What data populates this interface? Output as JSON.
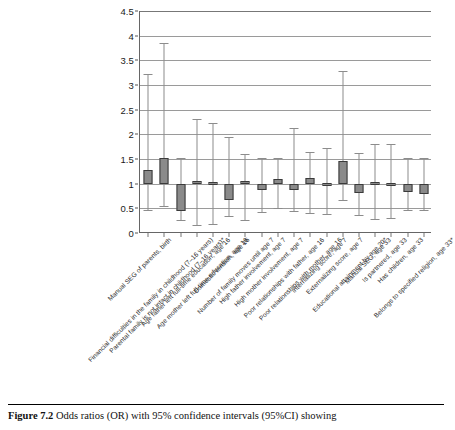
{
  "figure": {
    "caption_label": "Figure 7.2",
    "caption_text": "Odds ratios (OR) with 95% confidence intervals (95%CI) showing"
  },
  "chart_data": {
    "type": "bar",
    "title": "",
    "xlabel": "",
    "ylabel": "",
    "ylim": [
      0,
      4.5
    ],
    "grid": true,
    "legend": "none",
    "reference_line": 1,
    "ytick_labels": [
      "0",
      "0.5",
      "1",
      "1.5",
      "2",
      "2.5",
      "3",
      "3.5",
      "4",
      "4.5"
    ],
    "ytick_values": [
      0,
      0.5,
      1,
      1.5,
      2,
      2.5,
      3,
      3.5,
      4,
      4.5
    ],
    "value_label": "Odds ratio (OR)",
    "error_label": "95% confidence interval (95%CI)",
    "categories": [
      "Manual SEG of parents, birth",
      "Financial difficulties in the family in childhood (7–16 years)",
      "Parental family is not intact in childhood (7–16 years)*",
      "Age father left full-time education, age 16",
      "Age mother left full-time education, age 16",
      "Domestic tension, age 16",
      "Number of family moves until age 7",
      "High father involvement, age 7",
      "High mother involvement, age 7",
      "Poor relationships with father, age 16",
      "Poor relationships with mother, age 16",
      "Internalizing score, age 7",
      "Externalizing score, age 7",
      "Educational attainment by age 20*",
      "Manual SEG, age 33",
      "Is partnered, age 33",
      "Has children, age 33",
      "Belongs to specified religion, age 33*"
    ],
    "values": [
      1.18,
      1.45,
      0.72,
      1.04,
      1.02,
      0.82,
      1.04,
      0.94,
      1.06,
      0.98,
      1.08,
      1.0,
      1.32,
      0.9,
      1.02,
      1.0,
      0.9,
      0.9
    ],
    "ci_lower": [
      0.46,
      0.55,
      0.27,
      0.16,
      0.19,
      0.34,
      0.26,
      0.42,
      0.5,
      0.45,
      0.41,
      0.38,
      0.66,
      0.37,
      0.29,
      0.3,
      0.47,
      0.47
    ],
    "ci_upper": [
      3.22,
      3.85,
      1.52,
      2.32,
      2.23,
      1.94,
      1.6,
      1.52,
      1.53,
      2.12,
      1.65,
      1.73,
      3.28,
      1.62,
      1.8,
      1.8,
      1.52,
      1.52
    ],
    "bar_tops": [
      1.28,
      1.53,
      1.0,
      1.06,
      1.03,
      1.0,
      1.06,
      1.0,
      1.1,
      1.0,
      1.11,
      1.02,
      1.45,
      1.0,
      1.04,
      1.02,
      1.0,
      1.0
    ],
    "bar_bottoms": [
      1.0,
      1.0,
      0.44,
      1.0,
      1.0,
      0.66,
      1.0,
      0.88,
      1.0,
      0.87,
      1.0,
      1.0,
      1.0,
      0.82,
      1.0,
      1.0,
      0.83,
      0.8
    ]
  }
}
